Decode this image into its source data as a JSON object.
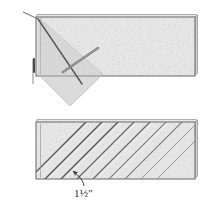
{
  "figure": {
    "background_color": "#ffffff",
    "panels": [
      {
        "id": "top-panel",
        "name": "board-with-square-marking-45-degree-line",
        "board": {
          "name": "wood-board",
          "fill_color": "#d8d8d8",
          "edge_color": "#6e6e6e",
          "x": 36,
          "y": 17,
          "width": 159,
          "height": 59,
          "texture": "mottled-wood-grain"
        },
        "annotations": [
          {
            "name": "square-tool-triangle",
            "type": "triangle",
            "color": "#c9c9c9",
            "angle_degrees": 45
          },
          {
            "name": "diagonal-layout-line",
            "type": "line",
            "angle_degrees": 45,
            "color": "#5a5a5a"
          },
          {
            "name": "pencil",
            "type": "line",
            "color": "#4a4a4a"
          },
          {
            "name": "short-diagonal-mark",
            "type": "line",
            "color": "#7a7a7a"
          },
          {
            "name": "tool-shadow",
            "type": "shadow",
            "color": "#e8e8e8"
          }
        ]
      },
      {
        "id": "bottom-panel",
        "name": "board-with-parallel-45-degree-kerfs",
        "board": {
          "name": "wood-board",
          "fill_color": "#d8d8d8",
          "edge_color": "#6e6e6e",
          "x": 36,
          "y": 122,
          "width": 159,
          "height": 57,
          "texture": "mottled-wood-grain"
        },
        "annotations": [
          {
            "name": "kerf-line",
            "type": "line",
            "angle_degrees": 45,
            "color": "#5e5e5e",
            "count": 9
          },
          {
            "name": "spacing-arrow",
            "type": "arrow",
            "color": "#3a3a3a"
          }
        ]
      }
    ]
  },
  "labels": {
    "spacing_dimension": "1",
    "spacing_fraction": "1/2",
    "spacing_unit": "″",
    "spacing_full": "1½″"
  }
}
